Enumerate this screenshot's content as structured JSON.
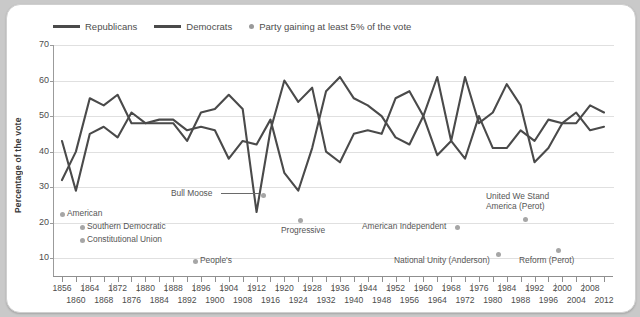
{
  "chart_data": {
    "type": "line",
    "title": "",
    "xlabel": "",
    "ylabel": "Percentage of the vote",
    "ylim": [
      5,
      70
    ],
    "yticks": [
      10,
      20,
      30,
      40,
      50,
      60,
      70
    ],
    "grid": true,
    "legend_position": "top-left",
    "legend": [
      {
        "label": "Republicans",
        "marker": "line"
      },
      {
        "label": "Democrats",
        "marker": "line"
      },
      {
        "label": "Party gaining at least 5% of the vote",
        "marker": "dot"
      }
    ],
    "x": [
      1856,
      1860,
      1864,
      1868,
      1872,
      1876,
      1880,
      1884,
      1888,
      1892,
      1896,
      1900,
      1904,
      1908,
      1912,
      1916,
      1920,
      1924,
      1928,
      1932,
      1936,
      1940,
      1944,
      1948,
      1952,
      1956,
      1960,
      1964,
      1968,
      1972,
      1976,
      1980,
      1984,
      1988,
      1992,
      1996,
      2000,
      2004,
      2008,
      2012
    ],
    "xtick_labels_top": [
      "1856",
      "1864",
      "1872",
      "1880",
      "1888",
      "1896",
      "1904",
      "1912",
      "1920",
      "1928",
      "1936",
      "1944",
      "1952",
      "1960",
      "1968",
      "1976",
      "1984",
      "1992",
      "2000",
      "2008"
    ],
    "xtick_labels_bottom": [
      "1860",
      "1868",
      "1876",
      "1884",
      "1892",
      "1900",
      "1908",
      "1916",
      "1924",
      "1932",
      "1940",
      "1948",
      "1956",
      "1964",
      "1972",
      "1980",
      "1988",
      "1996",
      "2004",
      "2012"
    ],
    "series": [
      {
        "name": "Republicans",
        "color": "#4a4a4a",
        "values": [
          32,
          40,
          55,
          53,
          56,
          48,
          48,
          48,
          48,
          43,
          51,
          52,
          56,
          52,
          23,
          46,
          60,
          54,
          58,
          40,
          37,
          45,
          46,
          45,
          55,
          57,
          50,
          39,
          43,
          61,
          48,
          51,
          59,
          53,
          37,
          41,
          48,
          51,
          46,
          47
        ]
      },
      {
        "name": "Democrats",
        "color": "#4a4a4a",
        "values": [
          43,
          29,
          45,
          47,
          44,
          51,
          48,
          49,
          49,
          46,
          47,
          46,
          38,
          43,
          42,
          49,
          34,
          29,
          41,
          57,
          61,
          55,
          53,
          50,
          44,
          42,
          50,
          61,
          43,
          38,
          50,
          41,
          41,
          46,
          43,
          49,
          48,
          48,
          53,
          51
        ]
      }
    ],
    "annotations": [
      {
        "text": "Bull Moose",
        "leader": true
      },
      {
        "text": "American"
      },
      {
        "text": "Southern Democratic"
      },
      {
        "text": "Constitutional Union"
      },
      {
        "text": "People's"
      },
      {
        "text": "Progressive"
      },
      {
        "text": "American Independent"
      },
      {
        "text": "National Unity (Anderson)"
      },
      {
        "text": "United We Stand America (Perot)"
      },
      {
        "text": "Reform (Perot)"
      }
    ]
  },
  "legend": {
    "republicans": "Republicans",
    "democrats": "Democrats",
    "third_party": "Party gaining at least 5% of the vote"
  },
  "axis": {
    "ylabel": "Percentage of the vote",
    "y10": "10",
    "y20": "20",
    "y30": "30",
    "y40": "40",
    "y50": "50",
    "y60": "60",
    "y70": "70"
  },
  "annotations": {
    "bull_moose": "Bull Moose",
    "american": "American",
    "southern_democratic": "Southern Democratic",
    "constitutional_union": "Constitutional Union",
    "peoples": "People's",
    "progressive": "Progressive",
    "american_independent": "American Independent",
    "national_unity": "National Unity (Anderson)",
    "united_we_stand_1": "United We Stand",
    "united_we_stand_2": "America (Perot)",
    "reform_perot": "Reform (Perot)"
  }
}
